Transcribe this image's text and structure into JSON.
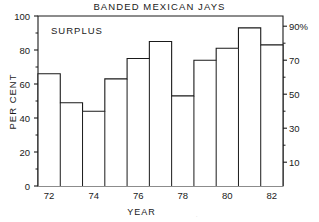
{
  "chart_data": {
    "type": "bar",
    "title": "BANDED MEXICAN JAYS",
    "xlabel": "YEAR",
    "ylabel": "PER CENT",
    "categories": [
      "1972",
      "1973",
      "1974",
      "1975",
      "1976",
      "1977",
      "1978",
      "1979",
      "1980",
      "1981",
      "1982"
    ],
    "values": [
      66,
      49,
      44,
      63,
      75,
      85,
      53,
      74,
      81,
      93,
      83
    ],
    "ylim": [
      0,
      100
    ],
    "yticks": [
      0,
      20,
      40,
      60,
      80,
      100
    ],
    "ytick_labels": [
      "0",
      "20",
      "40",
      "60",
      "80",
      "100"
    ],
    "y2ticks": [
      10,
      30,
      50,
      70,
      90
    ],
    "y2tick_labels": [
      "10",
      "30",
      "50",
      "70",
      "90%"
    ],
    "xticks": [
      "72",
      "74",
      "76",
      "78",
      "80",
      "82"
    ],
    "grid": false,
    "legend": "none",
    "annotations": [
      {
        "text": "SURPLUS",
        "x": 0.08,
        "y": 0.85
      },
      {
        "text": "BREEDING",
        "x": 0.45,
        "y": 0.28
      }
    ],
    "bar_style": "outline",
    "bar_color": "#ffffff",
    "line_color": "#1a1a1a"
  },
  "artifact": {
    "text": "."
  }
}
